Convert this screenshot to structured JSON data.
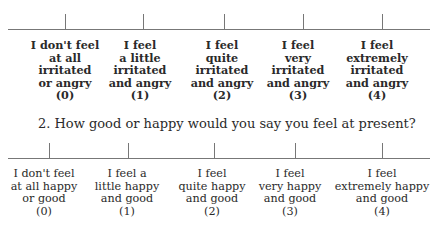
{
  "scale1": {
    "ticks_x": [
      65,
      143,
      224,
      303,
      382
    ],
    "options": [
      {
        "lines": [
          "I don't feel",
          "at all",
          "irritated",
          "or angry",
          "(0)"
        ]
      },
      {
        "lines": [
          "I feel",
          "a little",
          "irritated",
          "and angry",
          "(1)"
        ]
      },
      {
        "lines": [
          "I feel",
          "quite",
          "irritated",
          "and angry",
          "(2)"
        ]
      },
      {
        "lines": [
          "I feel",
          "very",
          "irritated",
          "and angry",
          "(3)"
        ]
      },
      {
        "lines": [
          "I feel",
          "extremely",
          "irritated",
          "and angry",
          "(4)"
        ]
      }
    ]
  },
  "question2": {
    "text": "2. How good or happy would you say you feel at present?"
  },
  "scale2": {
    "ticks_x": [
      49,
      128,
      214,
      295,
      382
    ],
    "options": [
      {
        "lines": [
          "I don't feel",
          "at all happy",
          "or good",
          "(0)"
        ]
      },
      {
        "lines": [
          "I feel a",
          "little happy",
          "and good",
          "(1)"
        ]
      },
      {
        "lines": [
          "I feel",
          "quite happy",
          "and good",
          "(2)"
        ]
      },
      {
        "lines": [
          "I feel",
          "very happy",
          "and good",
          "(3)"
        ]
      },
      {
        "lines": [
          "I feel",
          "extremely happy",
          "and good",
          "(4)"
        ]
      }
    ]
  }
}
